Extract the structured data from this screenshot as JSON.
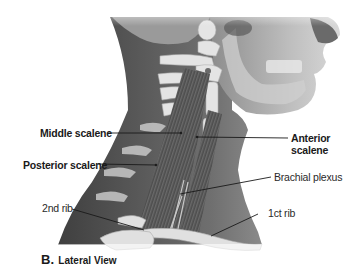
{
  "figure": {
    "view_letter": "B.",
    "view_title": "Lateral View"
  },
  "labels": {
    "middle_scalene": "Middle scalene",
    "posterior_scalene": "Posterior scalene",
    "anterior_scalene_line1": "Anterior",
    "anterior_scalene_line2": "scalene",
    "brachial_plexus": "Brachial plexus",
    "second_rib": "2nd rib",
    "first_rib": "1ct rib"
  },
  "colors": {
    "background": "#ffffff",
    "skin_dark": "#4a4a4a",
    "skin_mid": "#6e6e6e",
    "skin_light": "#9a9a9a",
    "bone": "#e6e6e6",
    "muscle": "#5a5a5a",
    "leader_line": "#1a1a1a",
    "text": "#1a1a1a"
  }
}
